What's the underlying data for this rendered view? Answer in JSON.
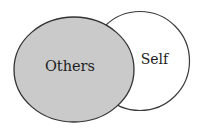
{
  "diagram": {
    "type": "overlapping-circles",
    "circles": [
      {
        "id": "self",
        "label": "Self",
        "cx": 140,
        "cy": 61,
        "rx": 49.5,
        "ry": 49.5,
        "fill": "#ffffff",
        "stroke": "#3a3a3a",
        "layer": "back"
      },
      {
        "id": "others",
        "label": "Others",
        "cx": 74,
        "cy": 69.5,
        "rx": 60,
        "ry": 52.5,
        "fill": "#cacaca",
        "stroke": "#333333",
        "layer": "front"
      }
    ]
  }
}
